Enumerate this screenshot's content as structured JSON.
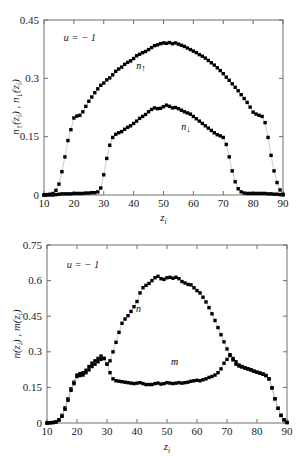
{
  "figure": {
    "background": "#ffffff",
    "marker_color": "#000000",
    "line_color": "#b4b4b4",
    "axis_color": "#6e6e6e",
    "caption_partial": ""
  },
  "chart_data": [
    {
      "id": "top",
      "type": "scatter",
      "title": "",
      "xlabel": "z_i",
      "ylabel": "n↑(z_i) , n↓(z_i)",
      "ylabel_parts": [
        "n",
        "↑",
        "(z",
        "i",
        ") , ",
        "n",
        "↓",
        "(z",
        "i",
        ")"
      ],
      "xlim": [
        10,
        90
      ],
      "ylim": [
        0,
        0.45
      ],
      "xticks": [
        10,
        20,
        30,
        40,
        50,
        60,
        70,
        80,
        90
      ],
      "xticklabels": [
        "10",
        "20",
        "30",
        "40",
        "50",
        "60",
        "70",
        "80",
        "90"
      ],
      "yticks": [
        0,
        0.15,
        0.3,
        0.45
      ],
      "yticklabels": [
        "0",
        "0.15",
        "0.3",
        "0.45"
      ],
      "grid": false,
      "legend": "none",
      "annotations": [
        {
          "text": "u = − 1",
          "x": 22,
          "y": 0.395,
          "name": "u-parameter-annotation"
        },
        {
          "text": "n↑",
          "x": 42.5,
          "y": 0.325,
          "name": "n-up-curve-label"
        },
        {
          "text": "n↓",
          "x": 57.5,
          "y": 0.168,
          "name": "n-down-curve-label"
        }
      ],
      "series": [
        {
          "name": "n_up",
          "label": "n↑",
          "x": [
            10,
            11,
            12,
            13,
            14,
            15,
            16,
            17,
            18,
            19,
            20,
            21,
            22,
            23,
            24,
            25,
            26,
            27,
            28,
            29,
            30,
            31,
            32,
            33,
            34,
            35,
            36,
            37,
            38,
            39,
            40,
            41,
            42,
            43,
            44,
            45,
            46,
            47,
            48,
            49,
            50,
            51,
            52,
            53,
            54,
            55,
            56,
            57,
            58,
            59,
            60,
            61,
            62,
            63,
            64,
            65,
            66,
            67,
            68,
            69,
            70,
            71,
            72,
            73,
            74,
            75,
            76,
            77,
            78,
            79,
            80,
            81,
            82,
            83,
            84,
            85,
            86,
            87,
            88,
            89,
            90
          ],
          "values": [
            0.0,
            0.001,
            0.002,
            0.004,
            0.012,
            0.028,
            0.06,
            0.098,
            0.14,
            0.168,
            0.198,
            0.203,
            0.205,
            0.214,
            0.228,
            0.241,
            0.252,
            0.263,
            0.273,
            0.282,
            0.288,
            0.296,
            0.301,
            0.309,
            0.318,
            0.324,
            0.329,
            0.336,
            0.341,
            0.345,
            0.351,
            0.358,
            0.362,
            0.366,
            0.369,
            0.374,
            0.379,
            0.384,
            0.386,
            0.389,
            0.391,
            0.39,
            0.392,
            0.389,
            0.391,
            0.388,
            0.385,
            0.382,
            0.378,
            0.374,
            0.37,
            0.366,
            0.361,
            0.357,
            0.352,
            0.346,
            0.34,
            0.334,
            0.327,
            0.32,
            0.312,
            0.303,
            0.295,
            0.286,
            0.277,
            0.268,
            0.258,
            0.248,
            0.238,
            0.226,
            0.213,
            0.208,
            0.205,
            0.202,
            0.186,
            0.148,
            0.102,
            0.062,
            0.032,
            0.013,
            0.002
          ]
        },
        {
          "name": "n_down",
          "label": "n↓",
          "x": [
            10,
            11,
            12,
            13,
            14,
            15,
            16,
            17,
            18,
            19,
            20,
            21,
            22,
            23,
            24,
            25,
            26,
            27,
            28,
            29,
            30,
            31,
            32,
            33,
            34,
            35,
            36,
            37,
            38,
            39,
            40,
            41,
            42,
            43,
            44,
            45,
            46,
            47,
            48,
            49,
            50,
            51,
            52,
            53,
            54,
            55,
            56,
            57,
            58,
            59,
            60,
            61,
            62,
            63,
            64,
            65,
            66,
            67,
            68,
            69,
            70,
            71,
            72,
            73,
            74,
            75,
            76,
            77,
            78,
            79,
            80,
            81,
            82,
            83,
            84,
            85,
            86,
            87,
            88,
            89,
            90
          ],
          "values": [
            0.0,
            0.0,
            0.0,
            0.0,
            0.001,
            0.002,
            0.003,
            0.003,
            0.003,
            0.003,
            0.004,
            0.004,
            0.004,
            0.004,
            0.005,
            0.005,
            0.006,
            0.006,
            0.008,
            0.018,
            0.052,
            0.094,
            0.128,
            0.148,
            0.156,
            0.16,
            0.163,
            0.169,
            0.174,
            0.178,
            0.184,
            0.19,
            0.197,
            0.202,
            0.207,
            0.214,
            0.22,
            0.224,
            0.222,
            0.223,
            0.227,
            0.231,
            0.228,
            0.224,
            0.225,
            0.222,
            0.218,
            0.214,
            0.211,
            0.208,
            0.202,
            0.196,
            0.19,
            0.184,
            0.178,
            0.172,
            0.166,
            0.16,
            0.155,
            0.152,
            0.148,
            0.13,
            0.098,
            0.062,
            0.034,
            0.016,
            0.008,
            0.005,
            0.004,
            0.004,
            0.004,
            0.004,
            0.004,
            0.004,
            0.004,
            0.003,
            0.003,
            0.002,
            0.002,
            0.001,
            0.0
          ]
        }
      ]
    },
    {
      "id": "bottom",
      "type": "scatter",
      "title": "",
      "xlabel": "z_i",
      "ylabel": "n(z_i) , m(z_i)",
      "ylabel_parts": [
        "n",
        "(z",
        "i",
        ") , ",
        "m",
        "(z",
        "i",
        ")"
      ],
      "xlim": [
        10,
        90
      ],
      "ylim": [
        0,
        0.75
      ],
      "xticks": [
        10,
        20,
        30,
        40,
        50,
        60,
        70,
        80,
        90
      ],
      "xticklabels": [
        "10",
        "20",
        "30",
        "40",
        "50",
        "60",
        "70",
        "80",
        "90"
      ],
      "yticks": [
        0,
        0.15,
        0.3,
        0.45,
        0.6,
        0.75
      ],
      "yticklabels": [
        "0",
        "0.15",
        "0.3",
        "0.45",
        "0.6",
        "0.75"
      ],
      "grid": false,
      "legend": "none",
      "annotations": [
        {
          "text": "u = − 1",
          "x": 22,
          "y": 0.655,
          "name": "u-parameter-annotation"
        },
        {
          "text": "n",
          "x": 40.5,
          "y": 0.468,
          "name": "n-curve-label"
        },
        {
          "text": "m",
          "x": 52.5,
          "y": 0.245,
          "name": "m-curve-label"
        }
      ],
      "series": [
        {
          "name": "n_total",
          "label": "n",
          "x": [
            10,
            11,
            12,
            13,
            14,
            15,
            16,
            17,
            18,
            19,
            20,
            21,
            22,
            23,
            24,
            25,
            26,
            27,
            28,
            29,
            30,
            31,
            32,
            33,
            34,
            35,
            36,
            37,
            38,
            39,
            40,
            41,
            42,
            43,
            44,
            45,
            46,
            47,
            48,
            49,
            50,
            51,
            52,
            53,
            54,
            55,
            56,
            57,
            58,
            59,
            60,
            61,
            62,
            63,
            64,
            65,
            66,
            67,
            68,
            69,
            70,
            71,
            72,
            73,
            74,
            75,
            76,
            77,
            78,
            79,
            80,
            81,
            82,
            83,
            84,
            85,
            86,
            87,
            88,
            89,
            90
          ],
          "values": [
            0.0,
            0.001,
            0.002,
            0.005,
            0.014,
            0.032,
            0.064,
            0.102,
            0.144,
            0.172,
            0.202,
            0.208,
            0.212,
            0.222,
            0.238,
            0.252,
            0.262,
            0.272,
            0.282,
            0.272,
            0.248,
            0.262,
            0.3,
            0.34,
            0.382,
            0.42,
            0.438,
            0.452,
            0.47,
            0.49,
            0.512,
            0.548,
            0.57,
            0.58,
            0.588,
            0.6,
            0.612,
            0.618,
            0.608,
            0.605,
            0.612,
            0.614,
            0.61,
            0.614,
            0.608,
            0.596,
            0.59,
            0.584,
            0.582,
            0.57,
            0.558,
            0.548,
            0.53,
            0.51,
            0.486,
            0.46,
            0.432,
            0.402,
            0.372,
            0.342,
            0.312,
            0.288,
            0.272,
            0.258,
            0.244,
            0.238,
            0.232,
            0.228,
            0.224,
            0.218,
            0.214,
            0.21,
            0.206,
            0.2,
            0.186,
            0.148,
            0.102,
            0.062,
            0.032,
            0.014,
            0.002
          ]
        },
        {
          "name": "m_magnetization",
          "label": "m",
          "x": [
            10,
            11,
            12,
            13,
            14,
            15,
            16,
            17,
            18,
            19,
            20,
            21,
            22,
            23,
            24,
            25,
            26,
            27,
            28,
            29,
            30,
            31,
            32,
            33,
            34,
            35,
            36,
            37,
            38,
            39,
            40,
            41,
            42,
            43,
            44,
            45,
            46,
            47,
            48,
            49,
            50,
            51,
            52,
            53,
            54,
            55,
            56,
            57,
            58,
            59,
            60,
            61,
            62,
            63,
            64,
            65,
            66,
            67,
            68,
            69,
            70,
            71,
            72,
            73,
            74,
            75,
            76,
            77,
            78,
            79,
            80,
            81,
            82,
            83,
            84,
            85,
            86,
            87,
            88,
            89,
            90
          ],
          "values": [
            0.0,
            0.001,
            0.002,
            0.004,
            0.012,
            0.028,
            0.058,
            0.096,
            0.138,
            0.166,
            0.196,
            0.2,
            0.202,
            0.212,
            0.224,
            0.238,
            0.248,
            0.258,
            0.268,
            0.272,
            0.248,
            0.212,
            0.186,
            0.178,
            0.176,
            0.174,
            0.172,
            0.17,
            0.168,
            0.166,
            0.168,
            0.17,
            0.166,
            0.162,
            0.162,
            0.162,
            0.166,
            0.168,
            0.164,
            0.166,
            0.17,
            0.168,
            0.166,
            0.168,
            0.17,
            0.168,
            0.17,
            0.172,
            0.176,
            0.178,
            0.18,
            0.178,
            0.182,
            0.186,
            0.192,
            0.196,
            0.202,
            0.212,
            0.228,
            0.252,
            0.268,
            0.284,
            0.266,
            0.248,
            0.24,
            0.236,
            0.232,
            0.228,
            0.224,
            0.218,
            0.214,
            0.21,
            0.206,
            0.2,
            0.186,
            0.148,
            0.102,
            0.062,
            0.032,
            0.013,
            0.002
          ]
        }
      ]
    }
  ]
}
